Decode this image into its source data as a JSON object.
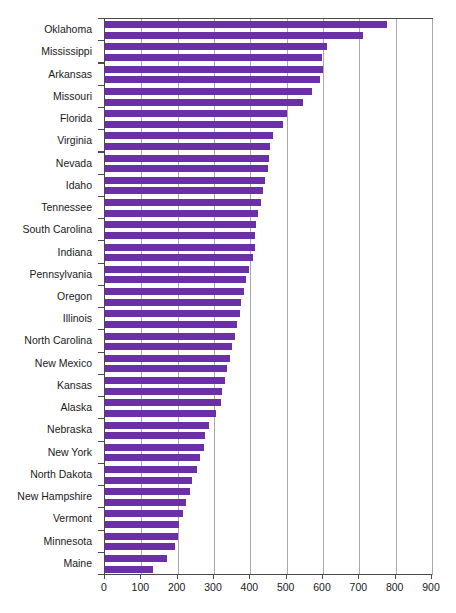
{
  "chart_data": {
    "type": "bar",
    "orientation": "horizontal",
    "title": "",
    "subtitle": "",
    "xlabel": "",
    "ylabel": "",
    "xlim": [
      0,
      900
    ],
    "ylim": null,
    "grid": true,
    "grid_axis": "x",
    "legend": null,
    "legend_position": "none",
    "bar_color": "#6B2FA8",
    "axis_color": "#4a4a4a",
    "gridline_color": "#a9a9a9",
    "background": "#ffffff",
    "xticks": [
      0,
      100,
      200,
      300,
      400,
      500,
      600,
      700,
      800,
      900
    ],
    "xticklabels": [
      "0",
      "100",
      "200",
      "300",
      "400",
      "500",
      "600",
      "700",
      "800",
      "900"
    ],
    "categories": [
      "Oklahoma",
      "Mississippi",
      "Arkansas",
      "Missouri",
      "Florida",
      "Virginia",
      "Nevada",
      "Idaho",
      "Tennessee",
      "South Carolina",
      "Indiana",
      "Pennsylvania",
      "Oregon",
      "Illinois",
      "North Carolina",
      "New Mexico",
      "Kansas",
      "Alaska",
      "Nebraska",
      "New York",
      "North Dakota",
      "New Hampshire",
      "Vermont",
      "Minnesota",
      "Maine"
    ],
    "series": [
      {
        "name": "upper",
        "values": [
          775,
          612,
          600,
          570,
          500,
          463,
          450,
          440,
          430,
          415,
          412,
          395,
          382,
          372,
          358,
          345,
          330,
          320,
          285,
          272,
          252,
          235,
          215,
          200,
          172
        ]
      },
      {
        "name": "lower",
        "values": [
          710,
          598,
          592,
          545,
          490,
          455,
          448,
          435,
          422,
          413,
          406,
          388,
          375,
          362,
          350,
          336,
          322,
          305,
          275,
          262,
          240,
          222,
          205,
          192,
          132
        ]
      }
    ]
  }
}
